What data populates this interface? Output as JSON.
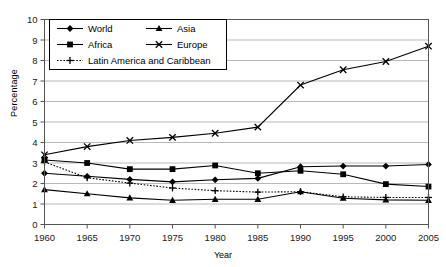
{
  "chart_data": {
    "type": "line",
    "title": "",
    "xlabel": "Year",
    "ylabel": "Percentage",
    "categories": [
      1960,
      1965,
      1970,
      1975,
      1980,
      1985,
      1990,
      1995,
      2000,
      2005
    ],
    "x_tick_labels": [
      "1960",
      "1965",
      "1970",
      "1975",
      "1980",
      "1985",
      "1990",
      "1995",
      "2000",
      "2005"
    ],
    "y_tick_labels": [
      "0",
      "1",
      "2",
      "3",
      "4",
      "5",
      "6",
      "7",
      "8",
      "9",
      "10"
    ],
    "xlim": [
      1960,
      2005
    ],
    "ylim": [
      0,
      10
    ],
    "y_tick_step": 1,
    "grid": "horizontal",
    "legend_position": "top-left-inside",
    "series": [
      {
        "name": "World",
        "marker": "filled-diamond",
        "line": "solid",
        "color": "#000000",
        "values": [
          2.5,
          2.35,
          2.2,
          2.08,
          2.18,
          2.25,
          2.82,
          2.85,
          2.85,
          2.93
        ]
      },
      {
        "name": "Asia",
        "marker": "filled-triangle",
        "line": "solid",
        "color": "#000000",
        "values": [
          1.7,
          1.5,
          1.3,
          1.18,
          1.23,
          1.23,
          1.6,
          1.28,
          1.2,
          1.18
        ]
      },
      {
        "name": "Africa",
        "marker": "filled-square",
        "line": "solid",
        "color": "#000000",
        "values": [
          3.15,
          3.0,
          2.7,
          2.7,
          2.88,
          2.5,
          2.62,
          2.45,
          1.97,
          1.85
        ]
      },
      {
        "name": "Europe",
        "marker": "cross-x",
        "line": "solid",
        "color": "#000000",
        "values": [
          3.4,
          3.8,
          4.1,
          4.25,
          4.45,
          4.75,
          6.8,
          7.55,
          7.95,
          8.7
        ]
      },
      {
        "name": "Latin America and Caribbean",
        "marker": "plus",
        "line": "dotted",
        "color": "#000000",
        "values": [
          3.05,
          2.28,
          2.02,
          1.78,
          1.65,
          1.58,
          1.6,
          1.35,
          1.32,
          1.32
        ]
      }
    ]
  },
  "legend": {
    "items": [
      {
        "label": "World"
      },
      {
        "label": "Asia"
      },
      {
        "label": "Africa"
      },
      {
        "label": "Europe"
      },
      {
        "label": "Latin America and Caribbean"
      }
    ]
  }
}
